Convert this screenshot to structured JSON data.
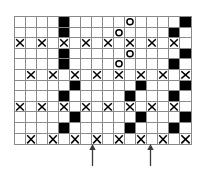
{
  "chart_data": {
    "type": "table",
    "title": "",
    "xlabel": "",
    "ylabel": "",
    "grid": {
      "columns": 16,
      "rows": 12,
      "cell_width": 11,
      "cell_height": 10.6,
      "border_color": "#8a8a8a",
      "fill_color": "#000000",
      "background_color": "#ffffff"
    },
    "legend": [
      {
        "symbol": "blank",
        "name": "empty-cell"
      },
      {
        "symbol": "filled",
        "name": "filled-square"
      },
      {
        "symbol": "x",
        "name": "cross-stitch"
      },
      {
        "symbol": "o",
        "name": "open-circle"
      }
    ],
    "cells": [
      [
        "blank",
        "blank",
        "blank",
        "blank",
        "filled",
        "blank",
        "blank",
        "blank",
        "blank",
        "blank",
        "o",
        "blank",
        "blank",
        "blank",
        "blank",
        "filled"
      ],
      [
        "blank",
        "blank",
        "blank",
        "blank",
        "filled",
        "blank",
        "blank",
        "blank",
        "blank",
        "o",
        "blank",
        "blank",
        "blank",
        "blank",
        "filled",
        "blank"
      ],
      [
        "x",
        "blank",
        "x",
        "blank",
        "x",
        "blank",
        "x",
        "blank",
        "x",
        "blank",
        "x",
        "blank",
        "x",
        "blank",
        "x",
        "blank"
      ],
      [
        "blank",
        "blank",
        "blank",
        "blank",
        "filled",
        "blank",
        "blank",
        "blank",
        "blank",
        "blank",
        "o",
        "blank",
        "blank",
        "blank",
        "blank",
        "filled"
      ],
      [
        "blank",
        "blank",
        "blank",
        "blank",
        "filled",
        "blank",
        "blank",
        "blank",
        "blank",
        "o",
        "blank",
        "blank",
        "blank",
        "blank",
        "filled",
        "blank"
      ],
      [
        "blank",
        "x",
        "blank",
        "x",
        "blank",
        "x",
        "blank",
        "x",
        "blank",
        "x",
        "blank",
        "x",
        "blank",
        "x",
        "blank",
        "x"
      ],
      [
        "blank",
        "blank",
        "blank",
        "blank",
        "blank",
        "filled",
        "blank",
        "blank",
        "blank",
        "blank",
        "blank",
        "filled",
        "blank",
        "blank",
        "blank",
        "filled"
      ],
      [
        "blank",
        "blank",
        "blank",
        "blank",
        "filled",
        "blank",
        "blank",
        "blank",
        "blank",
        "blank",
        "filled",
        "blank",
        "blank",
        "blank",
        "filled",
        "blank"
      ],
      [
        "x",
        "blank",
        "x",
        "blank",
        "x",
        "blank",
        "x",
        "blank",
        "x",
        "blank",
        "x",
        "blank",
        "x",
        "blank",
        "x",
        "blank"
      ],
      [
        "blank",
        "blank",
        "blank",
        "blank",
        "blank",
        "filled",
        "blank",
        "blank",
        "blank",
        "blank",
        "blank",
        "filled",
        "blank",
        "blank",
        "blank",
        "filled"
      ],
      [
        "blank",
        "blank",
        "blank",
        "blank",
        "filled",
        "blank",
        "blank",
        "blank",
        "blank",
        "blank",
        "filled",
        "blank",
        "blank",
        "blank",
        "filled",
        "blank"
      ],
      [
        "blank",
        "x",
        "blank",
        "x",
        "blank",
        "x",
        "blank",
        "x",
        "blank",
        "x",
        "blank",
        "x",
        "blank",
        "x",
        "blank",
        "x"
      ]
    ],
    "annotations": [
      {
        "name": "repeat-start-arrow",
        "symbol": "arrow-up",
        "x": 92,
        "label": ""
      },
      {
        "name": "repeat-end-arrow",
        "symbol": "arrow-up",
        "x": 150,
        "label": ""
      }
    ]
  }
}
